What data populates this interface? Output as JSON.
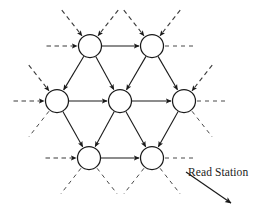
{
  "figure": {
    "type": "node-graph-diagram",
    "background_color": "#ffffff",
    "stroke_color": "#1a1a1a",
    "annotation": {
      "label": "Read Station",
      "x": 188,
      "y": 166,
      "pointer": {
        "from_x": 186,
        "from_y": 172,
        "to_x": 231,
        "to_y": 203,
        "arrowhead": "solid-filled"
      }
    }
  },
  "nodes": [
    {
      "id": "n-top-left",
      "row": 0,
      "col": 0,
      "cx": 90,
      "cy": 46,
      "r": 11.5
    },
    {
      "id": "n-top-right",
      "row": 0,
      "col": 1,
      "cx": 152,
      "cy": 46,
      "r": 11.5
    },
    {
      "id": "n-mid-left",
      "row": 1,
      "col": 0,
      "cx": 57,
      "cy": 101,
      "r": 11.5
    },
    {
      "id": "n-mid-center",
      "row": 1,
      "col": 1,
      "cx": 120,
      "cy": 101,
      "r": 11.5
    },
    {
      "id": "n-mid-right",
      "row": 1,
      "col": 2,
      "cx": 184,
      "cy": 101,
      "r": 11.5
    },
    {
      "id": "n-bot-left",
      "row": 2,
      "col": 0,
      "cx": 89,
      "cy": 158,
      "r": 11.5
    },
    {
      "id": "n-bot-right",
      "row": 2,
      "col": 1,
      "cx": 152,
      "cy": 158,
      "r": 11.5
    }
  ],
  "internal_edges": [
    {
      "id": "e-top-lr",
      "from": "n-top-left",
      "to": "n-top-right",
      "style": "solid",
      "arrowhead": true
    },
    {
      "id": "e-mid-lc",
      "from": "n-mid-left",
      "to": "n-mid-center",
      "style": "solid",
      "arrowhead": true
    },
    {
      "id": "e-mid-cr",
      "from": "n-mid-center",
      "to": "n-mid-right",
      "style": "solid",
      "arrowhead": true
    },
    {
      "id": "e-bot-lr",
      "from": "n-bot-left",
      "to": "n-bot-right",
      "style": "solid",
      "arrowhead": true
    },
    {
      "id": "e-tl-to-ml",
      "from": "n-top-left",
      "to": "n-mid-left",
      "style": "solid",
      "arrowhead": true
    },
    {
      "id": "e-tl-to-mc",
      "from": "n-top-left",
      "to": "n-mid-center",
      "style": "solid",
      "arrowhead": true
    },
    {
      "id": "e-tr-to-mc",
      "from": "n-top-right",
      "to": "n-mid-center",
      "style": "solid",
      "arrowhead": true
    },
    {
      "id": "e-tr-to-mr",
      "from": "n-top-right",
      "to": "n-mid-right",
      "style": "solid",
      "arrowhead": true
    },
    {
      "id": "e-ml-to-bl",
      "from": "n-mid-left",
      "to": "n-bot-left",
      "style": "solid",
      "arrowhead": true
    },
    {
      "id": "e-mc-to-bl",
      "from": "n-mid-center",
      "to": "n-bot-left",
      "style": "solid",
      "arrowhead": true
    },
    {
      "id": "e-mc-to-br",
      "from": "n-mid-center",
      "to": "n-bot-right",
      "style": "solid",
      "arrowhead": true
    },
    {
      "id": "e-mr-to-br",
      "from": "n-mid-right",
      "to": "n-bot-right",
      "style": "solid",
      "arrowhead": true
    }
  ],
  "boundary_edges": [
    {
      "id": "b-in-tl-w",
      "node": "n-top-left",
      "dir": "west",
      "kind": "inbound",
      "style": "dashed",
      "arrowhead": true
    },
    {
      "id": "b-in-tl-nw",
      "node": "n-top-left",
      "dir": "northwest",
      "kind": "inbound",
      "style": "dashed",
      "arrowhead": true
    },
    {
      "id": "b-in-tl-ne",
      "node": "n-top-left",
      "dir": "northeast",
      "kind": "inbound",
      "style": "dashed",
      "arrowhead": true
    },
    {
      "id": "b-in-tr-nw",
      "node": "n-top-right",
      "dir": "northwest",
      "kind": "inbound",
      "style": "dashed",
      "arrowhead": true
    },
    {
      "id": "b-in-tr-ne",
      "node": "n-top-right",
      "dir": "northeast",
      "kind": "inbound",
      "style": "dashed",
      "arrowhead": true
    },
    {
      "id": "b-out-tr-e",
      "node": "n-top-right",
      "dir": "east",
      "kind": "outbound",
      "style": "dashed",
      "arrowhead": false
    },
    {
      "id": "b-in-ml-w",
      "node": "n-mid-left",
      "dir": "west",
      "kind": "inbound",
      "style": "dashed",
      "arrowhead": true
    },
    {
      "id": "b-in-ml-nw",
      "node": "n-mid-left",
      "dir": "northwest",
      "kind": "inbound",
      "style": "dashed",
      "arrowhead": true
    },
    {
      "id": "b-out-ml-sw",
      "node": "n-mid-left",
      "dir": "southwest",
      "kind": "outbound",
      "style": "dashed",
      "arrowhead": false
    },
    {
      "id": "b-in-mr-ne",
      "node": "n-mid-right",
      "dir": "northeast",
      "kind": "inbound",
      "style": "dashed",
      "arrowhead": true
    },
    {
      "id": "b-out-mr-e",
      "node": "n-mid-right",
      "dir": "east",
      "kind": "outbound",
      "style": "dashed",
      "arrowhead": false
    },
    {
      "id": "b-out-mr-se",
      "node": "n-mid-right",
      "dir": "southeast",
      "kind": "outbound",
      "style": "dashed",
      "arrowhead": false
    },
    {
      "id": "b-in-bl-w",
      "node": "n-bot-left",
      "dir": "west",
      "kind": "inbound",
      "style": "dashed",
      "arrowhead": true
    },
    {
      "id": "b-out-bl-sw",
      "node": "n-bot-left",
      "dir": "southwest",
      "kind": "outbound",
      "style": "dashed",
      "arrowhead": false
    },
    {
      "id": "b-out-bl-se",
      "node": "n-bot-left",
      "dir": "southeast",
      "kind": "outbound",
      "style": "dashed",
      "arrowhead": false
    },
    {
      "id": "b-out-br-e",
      "node": "n-bot-right",
      "dir": "east",
      "kind": "outbound",
      "style": "dashed",
      "arrowhead": false
    },
    {
      "id": "b-out-br-sw",
      "node": "n-bot-right",
      "dir": "southwest",
      "kind": "outbound",
      "style": "dashed",
      "arrowhead": false
    },
    {
      "id": "b-out-br-se",
      "node": "n-bot-right",
      "dir": "southeast",
      "kind": "outbound",
      "style": "dashed",
      "arrowhead": false
    }
  ]
}
